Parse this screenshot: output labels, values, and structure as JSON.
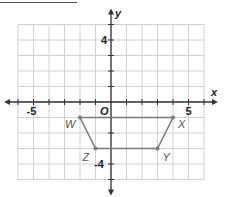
{
  "chart_data": {
    "type": "scatter",
    "title": "",
    "xlabel": "x",
    "ylabel": "y",
    "xlim": [
      -6,
      6
    ],
    "ylim": [
      -5,
      5
    ],
    "grid": true,
    "x_tick_labels": [
      "-5",
      "5"
    ],
    "y_tick_labels": [
      "4",
      "-4"
    ],
    "origin_label": "O",
    "polygon": {
      "name": "WXYZ",
      "closed": true,
      "points": [
        {
          "label": "W",
          "x": -2,
          "y": -1
        },
        {
          "label": "X",
          "x": 4,
          "y": -1
        },
        {
          "label": "Y",
          "x": 3,
          "y": -3
        },
        {
          "label": "Z",
          "x": -1,
          "y": -3
        }
      ]
    }
  },
  "colors": {
    "grid": "#d0d0d0",
    "axis": "#333333",
    "polygon": "#7a7a7a"
  }
}
